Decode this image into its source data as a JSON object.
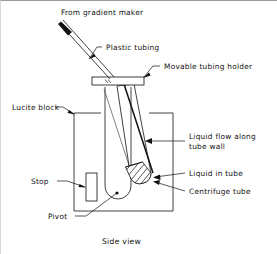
{
  "figure": {
    "caption": "Side view",
    "background_color": "#ffffff",
    "ink_color": "#111111"
  },
  "labels": {
    "from_gradient_maker": "From gradient maker",
    "plastic_tubing": "Plastic tubing",
    "movable_tubing_holder": "Movable tubing holder",
    "lucite_block": "Lucite block",
    "stop": "Stop",
    "pivot": "Pivot",
    "liquid_flow_line1": "Liquid flow along",
    "liquid_flow_line2": "tube wall",
    "liquid_in_tube": "Liquid in tube",
    "centrifuge_tube": "Centrifuge tube"
  },
  "parts": [
    {
      "id": "plastic-tubing",
      "label": "Plastic tubing"
    },
    {
      "id": "movable-tubing-holder",
      "label": "Movable tubing holder"
    },
    {
      "id": "lucite-block",
      "label": "Lucite block"
    },
    {
      "id": "stop",
      "label": "Stop"
    },
    {
      "id": "pivot",
      "label": "Pivot"
    },
    {
      "id": "centrifuge-tube",
      "label": "Centrifuge tube"
    },
    {
      "id": "liquid-in-tube",
      "label": "Liquid in tube"
    }
  ]
}
